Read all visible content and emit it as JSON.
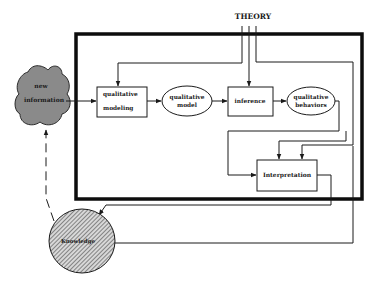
{
  "diagram": {
    "theory_label": "THEORY",
    "nodes": {
      "new_information": {
        "line1": "new",
        "line2": "information",
        "shape": "cloud",
        "fill": "#8a8a8a"
      },
      "qualitative_modeling": {
        "line1": "qualitative",
        "line2": "modeling",
        "shape": "rectangle"
      },
      "qualitative_model": {
        "line1": "qualitative",
        "line2": "model",
        "shape": "ellipse"
      },
      "inference": {
        "label": "inference",
        "shape": "rectangle"
      },
      "qualitative_behaviors": {
        "line1": "qualitative",
        "line2": "behaviors",
        "shape": "ellipse"
      },
      "interpretation": {
        "label": "Interpretation",
        "shape": "rectangle"
      },
      "knowledge": {
        "label": "Knowledge",
        "shape": "hatched-circle"
      }
    },
    "edges": [
      {
        "from": "new_information",
        "to": "qualitative_modeling"
      },
      {
        "from": "qualitative_modeling",
        "to": "qualitative_model"
      },
      {
        "from": "qualitative_model",
        "to": "inference"
      },
      {
        "from": "inference",
        "to": "qualitative_behaviors"
      },
      {
        "from": "qualitative_behaviors",
        "to": "interpretation"
      },
      {
        "from": "theory",
        "to": "qualitative_modeling"
      },
      {
        "from": "theory",
        "to": "inference"
      },
      {
        "from": "theory",
        "to": "interpretation"
      },
      {
        "from": "interpretation",
        "to": "knowledge"
      },
      {
        "from": "knowledge",
        "to": "interpretation"
      },
      {
        "from": "knowledge",
        "to": "new_information",
        "style": "dashed"
      }
    ],
    "colors": {
      "line": "#1a1a1a",
      "frame": "#0d0d0d",
      "cloud": "#8a8a8a",
      "hatch": "#555555"
    }
  }
}
